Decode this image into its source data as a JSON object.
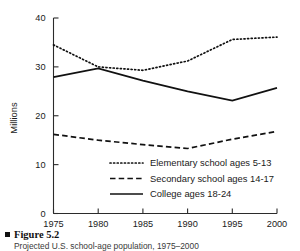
{
  "figure": {
    "bullet_icon": "square-bullet-icon",
    "title": "Figure 5.2",
    "subtitle": "Projected U.S. school-age population, 1975–2000"
  },
  "chart_data": {
    "type": "line",
    "title": "",
    "xlabel": "",
    "ylabel": "Millions",
    "x": [
      1975,
      1980,
      1985,
      1990,
      1995,
      2000
    ],
    "xticklabels": [
      "1975",
      "1980",
      "1985",
      "1990",
      "1995",
      "2000"
    ],
    "yticks": [
      0,
      10,
      20,
      30,
      40
    ],
    "yticklabels": [
      "0",
      "10",
      "20",
      "30",
      "40"
    ],
    "ylim": [
      0,
      40
    ],
    "xlim": [
      1975,
      2000
    ],
    "grid": false,
    "legend_position": "inside-lower-right",
    "series": [
      {
        "name": "Elementary school ages 5-13",
        "style": "dotted",
        "color": "#111111",
        "values": [
          34.5,
          30.0,
          29.3,
          31.2,
          35.6,
          36.1
        ]
      },
      {
        "name": "Secondary school ages 14-17",
        "style": "dashed",
        "color": "#111111",
        "values": [
          16.2,
          15.0,
          14.1,
          13.3,
          15.2,
          16.8
        ]
      },
      {
        "name": "College ages 18-24",
        "style": "solid",
        "color": "#111111",
        "values": [
          27.9,
          29.7,
          27.2,
          25.0,
          23.1,
          25.7
        ]
      }
    ]
  }
}
